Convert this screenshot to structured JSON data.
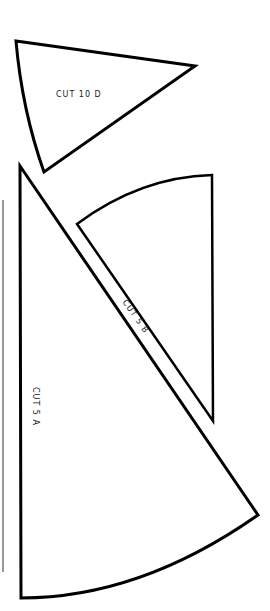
{
  "pieces": [
    {
      "id": "D",
      "label": "CUT 10 D"
    },
    {
      "id": "B",
      "label": "CUT 5 B"
    },
    {
      "id": "A",
      "label": "CUT 5 A"
    }
  ],
  "colors": {
    "stroke": "#000000",
    "background": "#ffffff",
    "edge_line": "#888888"
  }
}
